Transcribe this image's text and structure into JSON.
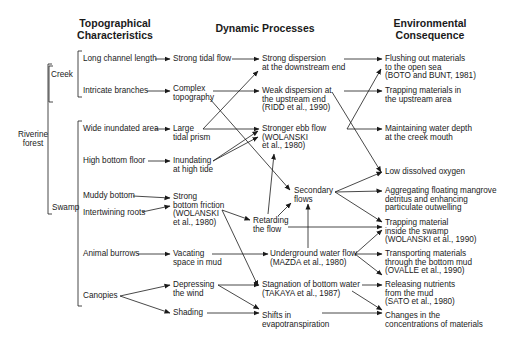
{
  "headers": {
    "topo": "Topographical\nCharacteristics",
    "dynamic": "Dynamic Processes",
    "env": "Environmental\nConsequence"
  },
  "groups": {
    "riverine": "Riverine\nforest",
    "creek": "Creek",
    "swamp": "Swamp"
  },
  "topo": [
    "Long channel length",
    "Intricate branches",
    "Wide inundated area",
    "High bottom floor",
    "Muddy bottom",
    "Intertwining roots",
    "Animal burrows",
    "Canopies"
  ],
  "proc1": [
    "Strong tidal flow",
    "Complex\ntopography",
    "Large\ntidal prism",
    "Inundating\nat high tide",
    "Strong\nbottom friction\n(WOLANSKI\net al., 1980)",
    "Vacating\nspace in mud",
    "Depressing\nthe wind",
    "Shading"
  ],
  "proc2": [
    "Strong dispersion\nat the downstream end",
    "Weak dispersion at\nthe upstream end\n(RIDD et al., 1990)",
    "Stronger ebb flow\n(WOLANSKI\net al., 1980)",
    "Secondary\nflows",
    "Retarding\nthe flow",
    "Underground water flow\n(MAZDA et al., 1980)",
    "Stagnation of bottom water\n(TAKAYA et al., 1987)",
    "Shifts in\nevapotranspiration"
  ],
  "env": [
    "Flushing out materials\nto the open sea\n(BOTO and BUNT, 1981)",
    "Trapping materials in\nthe upstream area",
    "Maintaining water depth\nat the creek mouth",
    "Low dissolved oxygen",
    "Aggregating floating mangrove\ndetritus and enhancing\nparticulate outwelling",
    "Trapping material\ninside the swamp\n(WOLANSKI et al., 1990)",
    "Transporting materials\nthrough the bottom mud\n(OVALLE et al., 1990)",
    "Releasing nutrients\nfrom the mud\n(SATO et al., 1980)",
    "Changes in the\nconcentrations of materials"
  ],
  "colors": {
    "line": "#1a1a1a",
    "text": "#1a1a1a",
    "background": "#ffffff"
  }
}
